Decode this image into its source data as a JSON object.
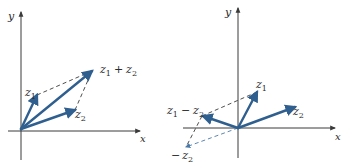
{
  "colors": {
    "vector": "#2f5f8f",
    "dashed_blue": "#4a78a8",
    "axis": "#3a3a3a",
    "background": "#ffffff"
  },
  "left_diagram": {
    "title": "Vector addition (parallelogram law)",
    "axis_x_label": "x",
    "axis_y_label": "y",
    "origin": [
      21,
      129
    ],
    "vectors": [
      {
        "name": "z1",
        "label_main": "z",
        "label_sub": "1",
        "tip": [
          37,
          95
        ]
      },
      {
        "name": "z2",
        "label_main": "z",
        "label_sub": "2",
        "tip": [
          75,
          110
        ]
      },
      {
        "name": "z1+z2",
        "label": "z1 + z2",
        "tip": [
          92,
          71
        ]
      }
    ],
    "sum_label": {
      "a_main": "z",
      "a_sub": "1",
      "op": "+",
      "b_main": "z",
      "b_sub": "2"
    }
  },
  "right_diagram": {
    "title": "Vector subtraction",
    "axis_x_label": "x",
    "axis_y_label": "y",
    "origin": [
      238,
      128
    ],
    "vectors": [
      {
        "name": "z1",
        "label_main": "z",
        "label_sub": "1",
        "tip": [
          257,
          92
        ]
      },
      {
        "name": "z2",
        "label_main": "z",
        "label_sub": "2",
        "tip": [
          295,
          107
        ]
      },
      {
        "name": "z1-z2",
        "label": "z1 − z2",
        "tip": [
          202,
          116
        ]
      },
      {
        "name": "-z2",
        "label": "− z2",
        "tip": [
          185,
          148
        ],
        "style": "dashed"
      }
    ],
    "diff_label": {
      "a_main": "z",
      "a_sub": "1",
      "op": "−",
      "b_main": "z",
      "b_sub": "2"
    },
    "neg_label": {
      "op": "−",
      "main": "z",
      "sub": "2"
    }
  }
}
